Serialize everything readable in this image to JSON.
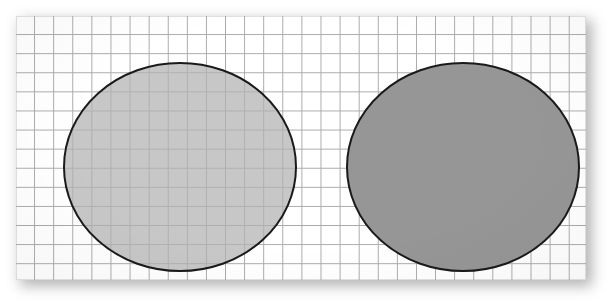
{
  "figure": {
    "background_color": "#ffffff",
    "paper": {
      "name": "graph-paper-sheet",
      "x": 16,
      "y": 16,
      "width": 570,
      "height": 264,
      "fill": "#ffffff",
      "grid_line_color": "#a9a9a9",
      "grid_cell_size_px": 19.1,
      "shadow_color": "#9a9a9a"
    },
    "shapes": [
      {
        "name": "left-ellipse",
        "type": "ellipse",
        "label": "translucent ellipse",
        "cx": 164,
        "cy": 151,
        "rx": 116,
        "ry": 104,
        "fill": "#b2b2b2",
        "fill_opacity": 0.72,
        "stroke": "#1a1a1a",
        "stroke_width": 2,
        "grid_visible_through": true
      },
      {
        "name": "right-ellipse",
        "type": "ellipse",
        "label": "opaque ellipse",
        "cx": 447,
        "cy": 151,
        "rx": 116,
        "ry": 104,
        "fill": "#969696",
        "fill_opacity": 1,
        "stroke": "#1a1a1a",
        "stroke_width": 2,
        "grid_visible_through": false
      }
    ]
  }
}
